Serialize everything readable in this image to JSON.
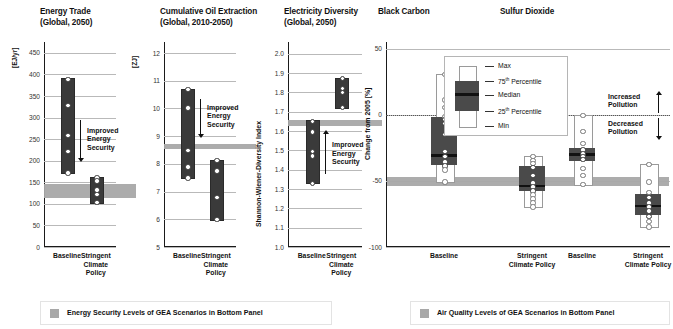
{
  "figure": {
    "width": 673,
    "height": 329,
    "band_color": "#a8a8a8",
    "bar_color": "#3a3a3a",
    "box_color": "#4a4a4a",
    "median_color": "#111111"
  },
  "left_panels": [
    {
      "key": "energy_trade",
      "title": "Energy Trade\n(Global, 2050)",
      "unit": "[EJ/yr]",
      "yticks": [
        "450",
        "400",
        "350",
        "300",
        "250",
        "200",
        "150",
        "100",
        "50",
        "0"
      ],
      "ymin": 0,
      "ymax": 475,
      "band": {
        "low": 113,
        "high": 145
      },
      "annotation": {
        "text": "Improved\nEnergy\nSecurity",
        "direction": "down"
      },
      "xticks": [
        "Baseline",
        "Stringent\nClimate\nPolicy"
      ],
      "groups": [
        {
          "label": "Baseline",
          "min": 174,
          "max": 391,
          "points": [
            391,
            330,
            261,
            224,
            174
          ]
        },
        {
          "label": "Stringent Climate Policy",
          "min": 105,
          "max": 162,
          "points": [
            162,
            155,
            134,
            124,
            105
          ]
        }
      ]
    },
    {
      "key": "cumulative_oil_extraction",
      "title": "Cumulative Oil Extraction\n(Global, 2010-2050)",
      "unit": "[ZJ]",
      "yticks": [
        "12",
        "11",
        "10",
        "9",
        "8",
        "7",
        "6",
        "5"
      ],
      "ymin": 5,
      "ymax": 12.4,
      "band": {
        "low": 8.52,
        "high": 8.72
      },
      "annotation": {
        "text": "Improved\nEnergy\nSecurity",
        "direction": "down"
      },
      "xticks": [
        "Baseline",
        "Stringent\nClimate\nPolicy"
      ],
      "groups": [
        {
          "label": "Baseline",
          "min": 7.53,
          "max": 10.72,
          "points": [
            10.72,
            10.05,
            8.52,
            7.92,
            7.53
          ]
        },
        {
          "label": "Stringent Climate Policy",
          "min": 6.02,
          "max": 8.15,
          "points": [
            8.15,
            7.78,
            6.83,
            6.02
          ]
        }
      ]
    },
    {
      "key": "electricity_diversity",
      "title": "Electricity Diversity\n(Global, 2050)",
      "unit": "Shannon-Wiener-Diversity Index",
      "yticks": [
        "2.0",
        "1.9",
        "1.8",
        "1.7",
        "1.6",
        "1.5",
        "1.4",
        "1.3",
        "1.2",
        "1.1",
        "1.0"
      ],
      "ymin": 1.0,
      "ymax": 2.06,
      "band": {
        "low": 1.625,
        "high": 1.655
      },
      "annotation": {
        "text": "Improved\nEnergy\nSecurity",
        "direction": "up"
      },
      "xticks": [
        "Baseline",
        "Stringent\nClimate\nPolicy"
      ],
      "groups": [
        {
          "label": "Baseline",
          "min": 1.335,
          "max": 1.655,
          "points": [
            1.655,
            1.6,
            1.5,
            1.475,
            1.335
          ]
        },
        {
          "label": "Stringent Climate Policy",
          "min": 1.725,
          "max": 1.875,
          "points": [
            1.875,
            1.825,
            1.805,
            1.725
          ]
        }
      ]
    }
  ],
  "right_panel": {
    "ylabel": "Change from 2005 [%]",
    "yticks": [
      "50",
      "0",
      "-50",
      "-100"
    ],
    "ymin": -100,
    "ymax": 55,
    "band": {
      "low": -54,
      "high": -47
    },
    "zero_reference": 0,
    "subpanels": [
      {
        "title": "Black Carbon",
        "groups": [
          {
            "label": "Baseline",
            "xtick": "Baseline",
            "max": 31,
            "p75": -2,
            "median": -31,
            "p25": -38,
            "min": -50,
            "points": [
              31,
              12,
              6,
              -1,
              -3,
              -6,
              -14,
              -27,
              -31,
              -35,
              -38,
              -41,
              -50
            ]
          },
          {
            "label": "Stringent Climate Policy",
            "xtick": "Stringent\nClimate Policy",
            "max": -31,
            "p75": -39,
            "median": -54,
            "p25": -58,
            "min": -69,
            "points": [
              -31,
              -34,
              -36,
              -39,
              -45,
              -51,
              -54,
              -57,
              -60,
              -63,
              -66,
              -69
            ]
          }
        ]
      },
      {
        "title": "Sulfur Dioxide",
        "groups": [
          {
            "label": "Baseline",
            "xtick": "Baseline",
            "max": 0,
            "p75": -25,
            "median": -30,
            "p25": -35,
            "min": -52,
            "points": [
              0,
              -12,
              -21,
              -26,
              -29,
              -31,
              -33,
              -40,
              -45,
              -52
            ]
          },
          {
            "label": "Stringent Climate Policy",
            "xtick": "Stringent\nClimate Policy",
            "max": -37,
            "p75": -60,
            "median": -69,
            "p25": -76,
            "min": -84,
            "points": [
              -37,
              -50,
              -58,
              -62,
              -66,
              -69,
              -72,
              -76,
              -80,
              -84
            ]
          }
        ]
      }
    ],
    "legend": {
      "items": [
        {
          "key": "max",
          "label": "Max"
        },
        {
          "key": "p75",
          "label": "75",
          "sup": "th",
          "rest": " Percentile"
        },
        {
          "key": "median",
          "label": "Median"
        },
        {
          "key": "p25",
          "label": "25",
          "sup": "th",
          "rest": " Percentile"
        },
        {
          "key": "min",
          "label": "Min"
        }
      ]
    },
    "pollution_annotations": [
      {
        "key": "increased",
        "text": "Increased\nPollution",
        "direction": "up"
      },
      {
        "key": "decreased",
        "text": "Decreased\nPollution",
        "direction": "down"
      }
    ]
  },
  "captions": [
    {
      "key": "energy_security",
      "swatch": "#a8a8a8",
      "text": "Energy Security Levels of GEA Scenarios in Bottom Panel"
    },
    {
      "key": "air_quality",
      "swatch": "#a8a8a8",
      "text": "Air Quality Levels of GEA Scenarios in Bottom Panel"
    }
  ]
}
